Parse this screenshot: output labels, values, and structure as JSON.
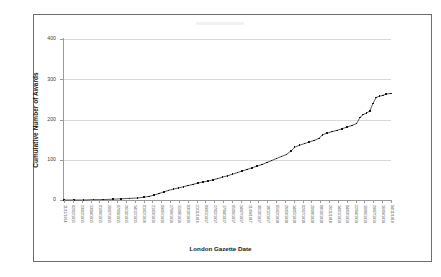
{
  "chart_data": {
    "type": "scatter",
    "title": "",
    "xlabel": "London Gazette Date",
    "ylabel": "Cumulative Number of Awards",
    "ylim": [
      0,
      400
    ],
    "yticks": [
      0,
      100,
      200,
      300,
      400
    ],
    "ytick_labels": [
      "0",
      "100",
      "200",
      "300",
      "400"
    ],
    "grid": "horizontal",
    "legend": "none",
    "marker": "small black square",
    "categories": [
      "11/11/1914",
      "02/02/1915",
      "23/02/1915",
      "13/04/1915",
      "01/06/1915",
      "20/07/1915",
      "07/09/1915",
      "26/10/1915",
      "14/12/1915",
      "01/02/1916",
      "21/03/1916",
      "09/05/1916",
      "27/06/1916",
      "15/08/1916",
      "03/10/1916",
      "21/11/1916",
      "09/01/1917",
      "27/02/1917",
      "17/04/1917",
      "05/06/1917",
      "24/07/1917",
      "11/09/1917",
      "30/10/1917",
      "18/12/1917",
      "05/02/1918",
      "26/03/1918",
      "14/05/1918",
      "02/07/1918",
      "20/08/1918",
      "08/10/1918",
      "26/11/1918",
      "14/01/1919",
      "04/03/1919",
      "22/04/1919",
      "10/06/1919",
      "29/07/1919",
      "16/09/1919",
      "04/11/1919"
    ],
    "series": [
      {
        "name": "Cumulative Number of Awards",
        "values": [
          0,
          0,
          0,
          1,
          2,
          3,
          4,
          5,
          6,
          8,
          11,
          14,
          18,
          22,
          27,
          33,
          40,
          48,
          57,
          66,
          76,
          86,
          97,
          108,
          120,
          133,
          146,
          158,
          170,
          183,
          196,
          212,
          228,
          240,
          252,
          260,
          264,
          265
        ]
      }
    ],
    "points": [
      {
        "x": 0.0,
        "y": 0
      },
      {
        "x": 0.03,
        "y": 0
      },
      {
        "x": 0.06,
        "y": 0
      },
      {
        "x": 0.09,
        "y": 1
      },
      {
        "x": 0.12,
        "y": 1
      },
      {
        "x": 0.15,
        "y": 2
      },
      {
        "x": 0.175,
        "y": 3
      },
      {
        "x": 0.2,
        "y": 4
      },
      {
        "x": 0.225,
        "y": 5
      },
      {
        "x": 0.245,
        "y": 7
      },
      {
        "x": 0.26,
        "y": 9
      },
      {
        "x": 0.275,
        "y": 12
      },
      {
        "x": 0.29,
        "y": 16
      },
      {
        "x": 0.305,
        "y": 20
      },
      {
        "x": 0.32,
        "y": 24
      },
      {
        "x": 0.335,
        "y": 27
      },
      {
        "x": 0.35,
        "y": 30
      },
      {
        "x": 0.365,
        "y": 33
      },
      {
        "x": 0.38,
        "y": 36
      },
      {
        "x": 0.395,
        "y": 39
      },
      {
        "x": 0.41,
        "y": 42
      },
      {
        "x": 0.425,
        "y": 45
      },
      {
        "x": 0.44,
        "y": 47
      },
      {
        "x": 0.455,
        "y": 50
      },
      {
        "x": 0.47,
        "y": 53
      },
      {
        "x": 0.485,
        "y": 57
      },
      {
        "x": 0.5,
        "y": 60
      },
      {
        "x": 0.515,
        "y": 64
      },
      {
        "x": 0.53,
        "y": 68
      },
      {
        "x": 0.545,
        "y": 72
      },
      {
        "x": 0.56,
        "y": 76
      },
      {
        "x": 0.575,
        "y": 80
      },
      {
        "x": 0.59,
        "y": 84
      },
      {
        "x": 0.605,
        "y": 88
      },
      {
        "x": 0.62,
        "y": 93
      },
      {
        "x": 0.635,
        "y": 98
      },
      {
        "x": 0.65,
        "y": 103
      },
      {
        "x": 0.665,
        "y": 108
      },
      {
        "x": 0.68,
        "y": 113
      },
      {
        "x": 0.695,
        "y": 122
      },
      {
        "x": 0.705,
        "y": 131
      },
      {
        "x": 0.72,
        "y": 136
      },
      {
        "x": 0.735,
        "y": 140
      },
      {
        "x": 0.75,
        "y": 144
      },
      {
        "x": 0.765,
        "y": 148
      },
      {
        "x": 0.78,
        "y": 153
      },
      {
        "x": 0.79,
        "y": 162
      },
      {
        "x": 0.805,
        "y": 166
      },
      {
        "x": 0.82,
        "y": 170
      },
      {
        "x": 0.835,
        "y": 173
      },
      {
        "x": 0.85,
        "y": 177
      },
      {
        "x": 0.865,
        "y": 181
      },
      {
        "x": 0.88,
        "y": 185
      },
      {
        "x": 0.895,
        "y": 190
      },
      {
        "x": 0.905,
        "y": 205
      },
      {
        "x": 0.915,
        "y": 212
      },
      {
        "x": 0.925,
        "y": 216
      },
      {
        "x": 0.935,
        "y": 221
      },
      {
        "x": 0.945,
        "y": 240
      },
      {
        "x": 0.955,
        "y": 255
      },
      {
        "x": 0.965,
        "y": 258
      },
      {
        "x": 0.975,
        "y": 260
      },
      {
        "x": 0.985,
        "y": 263
      },
      {
        "x": 1.0,
        "y": 265
      }
    ]
  },
  "colors": {
    "marker": "#141414",
    "grid": "#d9d9d9",
    "axis": "#9a9a9a",
    "border": "#6e6e6e",
    "text": "#1a1a1a"
  }
}
